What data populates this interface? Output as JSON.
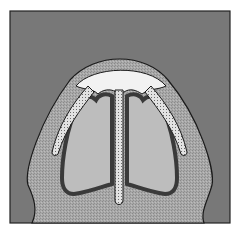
{
  "figure": {
    "colors": {
      "background": "#ffffff",
      "outer_field": "#7a7a7a",
      "tissue_band": "#a6a6a6",
      "cap": "#f2f2f2",
      "cavity_fill": "#bdbdbd",
      "cavity_wall": "#5c5c5c",
      "stripe_fill": "#d9d9d9",
      "outline": "#1a1a1a"
    },
    "elements": [
      "outer-frame",
      "dome-tissue-band",
      "white-cap",
      "left-cavity",
      "right-cavity",
      "central-septum-strip",
      "left-diagonal-strip",
      "right-diagonal-strip"
    ]
  }
}
